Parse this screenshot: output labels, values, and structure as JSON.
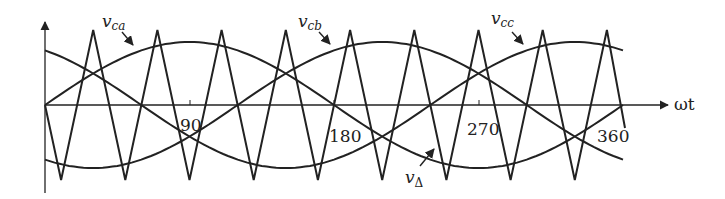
{
  "chart_data": {
    "type": "line",
    "title": "",
    "xlabel": "ωt",
    "ylabel": "",
    "x_ticks": [
      "90",
      "180",
      "270",
      "360"
    ],
    "x_range_deg": [
      0,
      360
    ],
    "grid": false,
    "legend": "inline arrow labels",
    "series": [
      {
        "name": "v_ca",
        "label": "v",
        "subscript": "ca",
        "kind": "sinusoid",
        "amplitude": 0.84,
        "phase_deg": 0,
        "description": "starts at 0, rises to peak near 90"
      },
      {
        "name": "v_cb",
        "label": "v",
        "subscript": "cb",
        "kind": "sinusoid",
        "amplitude": 0.84,
        "phase_deg": 240,
        "description": "starts high, falls"
      },
      {
        "name": "v_cc",
        "label": "v",
        "subscript": "cc",
        "kind": "sinusoid",
        "amplitude": 0.84,
        "phase_deg": 120,
        "description": "starts low, rises"
      },
      {
        "name": "v_Δ",
        "label": "v",
        "subscript": "Δ",
        "kind": "triangle carrier",
        "amplitude": 1.0,
        "carrier_ratio": 9
      }
    ]
  },
  "labels": {
    "v_ca": {
      "main": "v",
      "sub": "ca"
    },
    "v_cb": {
      "main": "v",
      "sub": "cb"
    },
    "v_cc": {
      "main": "v",
      "sub": "cc"
    },
    "v_delta": {
      "main": "v",
      "sub": "Δ"
    },
    "x_axis": "ωt",
    "tick_90": "90",
    "tick_180": "180",
    "tick_270": "270",
    "tick_360": "360"
  }
}
